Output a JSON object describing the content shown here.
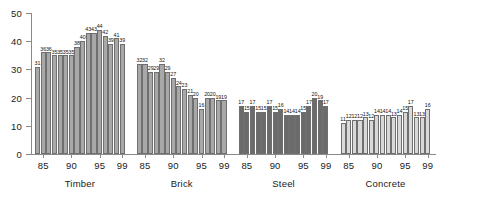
{
  "chart_data": {
    "type": "bar",
    "title": "",
    "subtitle": "",
    "xlabel": "",
    "ylabel": "",
    "ylim": [
      0,
      50
    ],
    "yticks": [
      0,
      10,
      20,
      30,
      40,
      50
    ],
    "grid": false,
    "legend": "none",
    "x": [
      "84",
      "85",
      "86",
      "87",
      "88",
      "89",
      "90",
      "91",
      "92",
      "93",
      "94",
      "95",
      "96",
      "97",
      "98",
      "99"
    ],
    "xtick_labels": [
      "85",
      "90",
      "95",
      "99"
    ],
    "xtick_positions": [
      1,
      6,
      11,
      15
    ],
    "groups": [
      {
        "name": "Timber",
        "color": "#a8a8a8",
        "values": [
          31,
          36,
          36,
          35,
          35,
          35,
          35,
          38,
          40,
          43,
          43,
          44,
          42,
          39,
          41,
          39
        ]
      },
      {
        "name": "Brick",
        "color": "#a8a8a8",
        "values": [
          32,
          32,
          29,
          29,
          32,
          29,
          27,
          24,
          23,
          21,
          20,
          16,
          20,
          20,
          19,
          19
        ]
      },
      {
        "name": "Steel",
        "color": "#6b6b6b",
        "values": [
          17,
          15,
          17,
          15,
          15,
          17,
          15,
          16,
          14,
          14,
          14,
          15,
          17,
          20,
          19,
          17
        ]
      },
      {
        "name": "Concrete",
        "color": "#d9d9d9",
        "values": [
          11,
          12,
          12,
          12,
          13,
          12,
          14,
          14,
          14,
          13,
          14,
          15,
          17,
          13,
          13,
          16
        ]
      }
    ]
  }
}
